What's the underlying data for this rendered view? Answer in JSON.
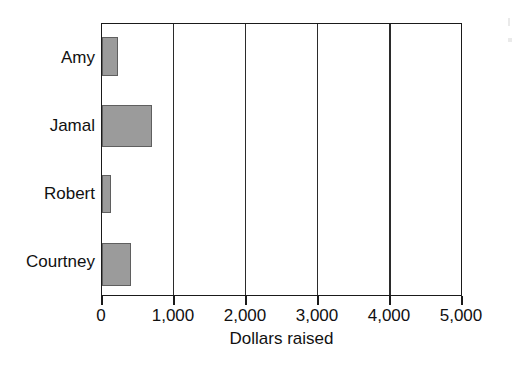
{
  "chart_data": {
    "type": "bar",
    "orientation": "horizontal",
    "title": "",
    "xlabel": "Dollars raised",
    "ylabel": "",
    "categories": [
      "Amy",
      "Jamal",
      "Robert",
      "Courtney"
    ],
    "values": [
      220,
      700,
      130,
      400
    ],
    "xlim": [
      0,
      5000
    ],
    "xticks": [
      0,
      1000,
      2000,
      3000,
      4000,
      5000
    ],
    "xticklabels": [
      "0",
      "1,000",
      "2,000",
      "3,000",
      "4,000",
      "5,000"
    ],
    "grid": "vertical",
    "legend": "none",
    "bar_color": "#9b9b9b",
    "bar_edge_color": "#5f5f5f",
    "axis_color": "#1a1a1a",
    "background": "#ffffff",
    "series": [
      {
        "name": "Dollars raised",
        "points": [
          {
            "category": "Amy",
            "value": 220
          },
          {
            "category": "Jamal",
            "value": 700
          },
          {
            "category": "Robert",
            "value": 130
          },
          {
            "category": "Courtney",
            "value": 400
          }
        ]
      }
    ]
  }
}
